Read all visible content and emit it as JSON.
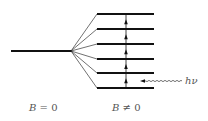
{
  "diagram": {
    "colors": {
      "line": "#111111",
      "text": "#555555"
    },
    "left_level": {
      "x1": 11,
      "x2": 71,
      "y": 51
    },
    "split_point": {
      "x": 71,
      "y": 51
    },
    "right_levels": [
      {
        "x1": 97,
        "x2": 154,
        "y": 14
      },
      {
        "x1": 97,
        "x2": 154,
        "y": 29
      },
      {
        "x1": 97,
        "x2": 154,
        "y": 44
      },
      {
        "x1": 97,
        "x2": 154,
        "y": 59
      },
      {
        "x1": 97,
        "x2": 154,
        "y": 73
      },
      {
        "x1": 97,
        "x2": 154,
        "y": 88
      }
    ],
    "transition_x": 126,
    "photon": {
      "x_start": 182,
      "x_end": 140,
      "y": 81,
      "label": "hν"
    },
    "labels": {
      "left": {
        "var": "B",
        "op": "=",
        "val": "0"
      },
      "right": {
        "var": "B",
        "op": "≠",
        "val": "0"
      }
    }
  }
}
